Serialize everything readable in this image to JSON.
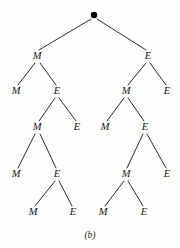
{
  "figure": {
    "caption": "(b)",
    "type": "binary-decision-tree",
    "background_color": "#fdfdfc",
    "ink_color": "#2a2a2a",
    "text_color": "#181818"
  },
  "tree": {
    "root": {
      "id": "root",
      "label": "",
      "glyph": "filled-dot",
      "x": 94,
      "y": 15,
      "radius": 3.2
    },
    "nodes": [
      {
        "id": "n-l1-left",
        "label": "M",
        "x": 37,
        "y": 59,
        "depth": 1
      },
      {
        "id": "n-l1-right",
        "label": "E",
        "x": 148,
        "y": 59,
        "depth": 1
      },
      {
        "id": "n-l2-a",
        "label": "M",
        "x": 16,
        "y": 94,
        "depth": 2
      },
      {
        "id": "n-l2-b",
        "label": "E",
        "x": 57,
        "y": 94,
        "depth": 2
      },
      {
        "id": "n-l2-c",
        "label": "M",
        "x": 126,
        "y": 94,
        "depth": 2
      },
      {
        "id": "n-l2-d",
        "label": "E",
        "x": 167,
        "y": 94,
        "depth": 2
      },
      {
        "id": "n-l3-a",
        "label": "M",
        "x": 37,
        "y": 130,
        "depth": 3
      },
      {
        "id": "n-l3-b",
        "label": "E",
        "x": 77,
        "y": 130,
        "depth": 3
      },
      {
        "id": "n-l3-c",
        "label": "M",
        "x": 105,
        "y": 130,
        "depth": 3
      },
      {
        "id": "n-l3-d",
        "label": "E",
        "x": 145,
        "y": 130,
        "depth": 3
      },
      {
        "id": "n-l4-a",
        "label": "M",
        "x": 16,
        "y": 177,
        "depth": 4
      },
      {
        "id": "n-l4-b",
        "label": "E",
        "x": 57,
        "y": 177,
        "depth": 4
      },
      {
        "id": "n-l4-c",
        "label": "M",
        "x": 126,
        "y": 177,
        "depth": 4
      },
      {
        "id": "n-l4-d",
        "label": "E",
        "x": 167,
        "y": 177,
        "depth": 4
      },
      {
        "id": "n-l5-a",
        "label": "M",
        "x": 33,
        "y": 215,
        "depth": 5
      },
      {
        "id": "n-l5-b",
        "label": "E",
        "x": 73,
        "y": 215,
        "depth": 5
      },
      {
        "id": "n-l5-c",
        "label": "M",
        "x": 103,
        "y": 215,
        "depth": 5
      },
      {
        "id": "n-l5-d",
        "label": "E",
        "x": 144,
        "y": 215,
        "depth": 5
      }
    ],
    "edges": [
      {
        "id": "e-root-l",
        "from": "root",
        "to": "n-l1-left",
        "x1": 91,
        "y1": 19,
        "x2": 39,
        "y2": 50
      },
      {
        "id": "e-root-r",
        "from": "root",
        "to": "n-l1-right",
        "x1": 97,
        "y1": 19,
        "x2": 146,
        "y2": 50
      },
      {
        "id": "e-l1l-l",
        "from": "n-l1-left",
        "to": "n-l2-a",
        "x1": 35,
        "y1": 63,
        "x2": 18,
        "y2": 85
      },
      {
        "id": "e-l1l-r",
        "from": "n-l1-left",
        "to": "n-l2-b",
        "x1": 40,
        "y1": 63,
        "x2": 56,
        "y2": 85
      },
      {
        "id": "e-l1r-l",
        "from": "n-l1-right",
        "to": "n-l2-c",
        "x1": 146,
        "y1": 63,
        "x2": 128,
        "y2": 85
      },
      {
        "id": "e-l1r-r",
        "from": "n-l1-right",
        "to": "n-l2-d",
        "x1": 150,
        "y1": 63,
        "x2": 166,
        "y2": 85
      },
      {
        "id": "e-l2b-l",
        "from": "n-l2-b",
        "to": "n-l3-a",
        "x1": 55,
        "y1": 98,
        "x2": 39,
        "y2": 121
      },
      {
        "id": "e-l2b-r",
        "from": "n-l2-b",
        "to": "n-l3-b",
        "x1": 59,
        "y1": 98,
        "x2": 76,
        "y2": 121
      },
      {
        "id": "e-l2c-l",
        "from": "n-l2-c",
        "to": "n-l3-c",
        "x1": 124,
        "y1": 98,
        "x2": 107,
        "y2": 121
      },
      {
        "id": "e-l2c-r",
        "from": "n-l2-c",
        "to": "n-l3-d",
        "x1": 128,
        "y1": 98,
        "x2": 144,
        "y2": 121
      },
      {
        "id": "e-l3a-l",
        "from": "n-l3-a",
        "to": "n-l4-a",
        "x1": 35,
        "y1": 134,
        "x2": 18,
        "y2": 168
      },
      {
        "id": "e-l3a-r",
        "from": "n-l3-a",
        "to": "n-l4-b",
        "x1": 40,
        "y1": 134,
        "x2": 56,
        "y2": 168
      },
      {
        "id": "e-l3d-l",
        "from": "n-l3-d",
        "to": "n-l4-c",
        "x1": 143,
        "y1": 134,
        "x2": 127,
        "y2": 168
      },
      {
        "id": "e-l3d-r",
        "from": "n-l3-d",
        "to": "n-l4-d",
        "x1": 147,
        "y1": 134,
        "x2": 166,
        "y2": 168
      },
      {
        "id": "e-l4b-l",
        "from": "n-l4-b",
        "to": "n-l5-a",
        "x1": 55,
        "y1": 181,
        "x2": 35,
        "y2": 206
      },
      {
        "id": "e-l4b-r",
        "from": "n-l4-b",
        "to": "n-l5-b",
        "x1": 59,
        "y1": 181,
        "x2": 72,
        "y2": 206
      },
      {
        "id": "e-l4c-l",
        "from": "n-l4-c",
        "to": "n-l5-c",
        "x1": 124,
        "y1": 181,
        "x2": 105,
        "y2": 206
      },
      {
        "id": "e-l4c-r",
        "from": "n-l4-c",
        "to": "n-l5-d",
        "x1": 128,
        "y1": 181,
        "x2": 143,
        "y2": 206
      }
    ]
  },
  "caption_position": {
    "x": 90,
    "y": 238
  }
}
